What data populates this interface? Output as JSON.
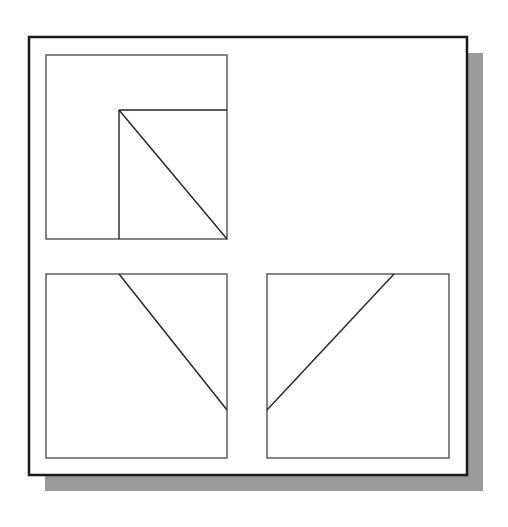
{
  "diagram": {
    "title": "",
    "type": "orthographic-views",
    "colors": {
      "background": "#ffffff",
      "frame_stroke": "#1a1a1a",
      "view_stroke": "#444444",
      "edge_stroke": "#222222",
      "shadow": "#9a9a9a"
    },
    "frame": {
      "x": 29,
      "y": 37,
      "width": 438,
      "height": 438,
      "shadow_offset": 16
    },
    "views": [
      {
        "name": "top-left-view",
        "box": {
          "x": 46,
          "y": 55,
          "width": 181,
          "height": 184
        },
        "lines": [
          {
            "x1": 119,
            "y1": 110,
            "x2": 227,
            "y2": 110
          },
          {
            "x1": 119,
            "y1": 110,
            "x2": 119,
            "y2": 239
          },
          {
            "x1": 119,
            "y1": 110,
            "x2": 227,
            "y2": 239
          }
        ]
      },
      {
        "name": "bottom-left-view",
        "box": {
          "x": 46,
          "y": 274,
          "width": 181,
          "height": 184
        },
        "lines": [
          {
            "x1": 119,
            "y1": 274,
            "x2": 227,
            "y2": 410
          }
        ]
      },
      {
        "name": "bottom-right-view",
        "box": {
          "x": 267,
          "y": 274,
          "width": 182,
          "height": 184
        },
        "lines": [
          {
            "x1": 267,
            "y1": 410,
            "x2": 394,
            "y2": 274
          }
        ]
      }
    ]
  }
}
